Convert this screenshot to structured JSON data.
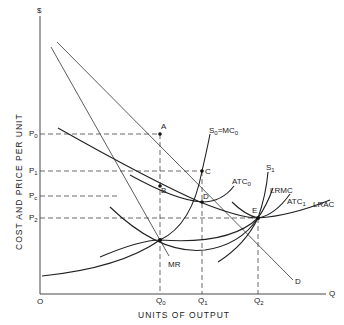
{
  "diagram": {
    "y_axis_symbol": "$",
    "x_axis_symbol": "Q",
    "origin": "O",
    "y_axis_title": "COST AND PRICE PER UNIT",
    "x_axis_title": "UNITS OF OUTPUT",
    "price_levels": [
      {
        "base": "P",
        "sub": "0"
      },
      {
        "base": "P",
        "sub": "1"
      },
      {
        "base": "P",
        "sub": "c"
      },
      {
        "base": "P",
        "sub": "2"
      }
    ],
    "quantity_levels": [
      {
        "base": "Q",
        "sub": "0"
      },
      {
        "base": "Q",
        "sub": "1"
      },
      {
        "base": "Q",
        "sub": "2"
      }
    ],
    "points": [
      "A",
      "B",
      "C",
      "D",
      "E"
    ],
    "curves": {
      "demand": "D",
      "marginal_revenue": "MR",
      "short_run_supply_0": {
        "base": "S",
        "sub": "0",
        "eq": "=MC",
        "eq_sub": "0"
      },
      "avg_total_cost_0": {
        "base": "ATC",
        "sub": "0"
      },
      "short_run_supply_1": {
        "base": "S",
        "sub": "1"
      },
      "long_run_marginal_cost": "LRMC",
      "avg_total_cost_1": {
        "base": "ATC",
        "sub": "1"
      },
      "long_run_average_cost": "LRAC"
    }
  }
}
